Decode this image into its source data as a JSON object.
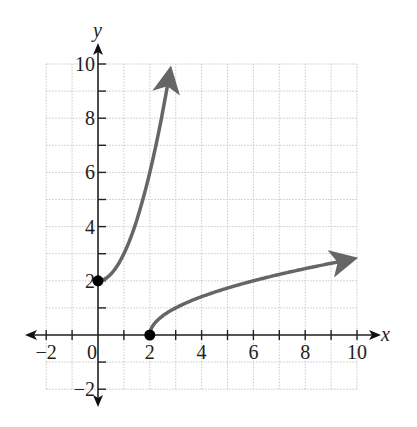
{
  "chart_data": {
    "type": "line",
    "title": "",
    "xlabel": "x",
    "ylabel": "y",
    "xlim": [
      -2,
      10
    ],
    "ylim": [
      -2,
      10
    ],
    "grid": true,
    "x_ticks": [
      -2,
      0,
      2,
      4,
      6,
      8,
      10
    ],
    "x_tick_labels": [
      "−2",
      "0",
      "2",
      "4",
      "6",
      "8",
      "10"
    ],
    "y_ticks": [
      -2,
      2,
      4,
      6,
      8,
      10
    ],
    "y_tick_labels": [
      "−2",
      "2",
      "4",
      "6",
      "8",
      "10"
    ],
    "series": [
      {
        "name": "curve-1",
        "description": "increasing curve from (0,2), arrow upward",
        "x": [
          0,
          0.5,
          1,
          1.5,
          2,
          2.5,
          2.8
        ],
        "y": [
          2,
          2.25,
          3,
          4.25,
          6,
          8.25,
          9.84
        ],
        "start_point": [
          0,
          2
        ],
        "end_arrow": true
      },
      {
        "name": "curve-2",
        "description": "square-root curve from (2,0), arrow rightward",
        "x": [
          2,
          2.5,
          3,
          4,
          5,
          6,
          7,
          8,
          9,
          10
        ],
        "y": [
          0,
          0.71,
          1,
          1.41,
          1.73,
          2,
          2.24,
          2.45,
          2.65,
          2.83
        ],
        "start_point": [
          2,
          0
        ],
        "end_arrow": true
      }
    ],
    "points": [
      [
        0,
        2
      ],
      [
        2,
        0
      ]
    ]
  },
  "labels": {
    "x_axis": "x",
    "y_axis": "y"
  }
}
